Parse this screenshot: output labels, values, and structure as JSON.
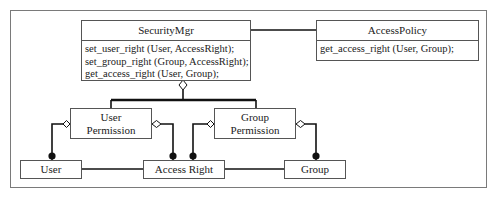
{
  "diagram": {
    "type": "UML class diagram",
    "classes": {
      "security_mgr": {
        "name": "SecurityMgr",
        "operations": [
          "set_user_right (User, AccessRight);",
          "set_group_right (Group, AccessRight);",
          "get_access_right (User, Group);"
        ]
      },
      "access_policy": {
        "name": "AccessPolicy",
        "operations": [
          "get_access_right (User, Group);"
        ]
      },
      "user_permission": {
        "line1": "User",
        "line2": "Permission"
      },
      "group_permission": {
        "line1": "Group",
        "line2": "Permission"
      },
      "user": {
        "name": "User"
      },
      "access_right": {
        "name": "Access Right"
      },
      "group": {
        "name": "Group"
      }
    },
    "relationships": [
      {
        "from": "SecurityMgr",
        "to": "AccessPolicy",
        "kind": "association"
      },
      {
        "from": "SecurityMgr",
        "to": "User Permission",
        "kind": "aggregation"
      },
      {
        "from": "SecurityMgr",
        "to": "Group Permission",
        "kind": "aggregation"
      },
      {
        "from": "User Permission",
        "to": "User",
        "kind": "aggregation-many"
      },
      {
        "from": "User Permission",
        "to": "Access Right",
        "kind": "aggregation-many"
      },
      {
        "from": "Group Permission",
        "to": "Access Right",
        "kind": "aggregation-many"
      },
      {
        "from": "Group Permission",
        "to": "Group",
        "kind": "aggregation-many"
      },
      {
        "from": "User",
        "to": "Access Right",
        "kind": "association"
      },
      {
        "from": "Access Right",
        "to": "Group",
        "kind": "association"
      }
    ],
    "colors": {
      "line": "#111111",
      "border": "#555555",
      "frame": "#7a7a7a",
      "background": "#ffffff"
    }
  }
}
